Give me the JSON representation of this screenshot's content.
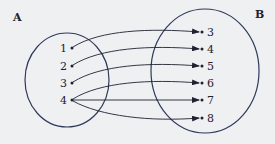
{
  "diagram": {
    "type": "mapping-diagram",
    "sets": {
      "A": {
        "label": "A",
        "elements": [
          "1",
          "2",
          "3",
          "4"
        ]
      },
      "B": {
        "label": "B",
        "elements": [
          "3",
          "4",
          "5",
          "6",
          "7",
          "8"
        ]
      }
    },
    "mappings": [
      {
        "from": "1",
        "to": "3"
      },
      {
        "from": "2",
        "to": "4"
      },
      {
        "from": "3",
        "to": "5"
      },
      {
        "from": "4",
        "to": "6"
      },
      {
        "from": "4",
        "to": "7"
      },
      {
        "from": "4",
        "to": "8"
      }
    ],
    "colors": {
      "background": "#eff0f2",
      "ink": "#1e2230",
      "ellipse": "#2e3a5c"
    }
  }
}
